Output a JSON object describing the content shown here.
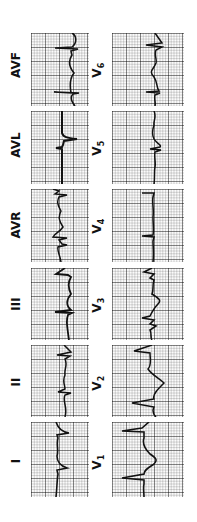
{
  "figure": {
    "orientation": "rotated -90deg",
    "leads": [
      {
        "id": "I",
        "label": "I",
        "column": "limb",
        "row": 6
      },
      {
        "id": "II",
        "label": "II",
        "column": "limb",
        "row": 5
      },
      {
        "id": "III",
        "label": "III",
        "column": "limb",
        "row": 4
      },
      {
        "id": "AVR",
        "label": "AVR",
        "column": "limb",
        "row": 3
      },
      {
        "id": "AVL",
        "label": "AVL",
        "column": "limb",
        "row": 2
      },
      {
        "id": "AVF",
        "label": "AVF",
        "column": "limb",
        "row": 1
      },
      {
        "id": "V1",
        "label": "V1",
        "column": "precordial",
        "row": 6
      },
      {
        "id": "V2",
        "label": "V2",
        "column": "precordial",
        "row": 5
      },
      {
        "id": "V3",
        "label": "V3",
        "column": "precordial",
        "row": 4
      },
      {
        "id": "V4",
        "label": "V4",
        "column": "precordial",
        "row": 3
      },
      {
        "id": "V5",
        "label": "V5",
        "column": "precordial",
        "row": 2
      },
      {
        "id": "V6",
        "label": "V6",
        "column": "precordial",
        "row": 1
      }
    ]
  },
  "labels": {
    "I": "I",
    "II": "II",
    "III": "III",
    "AVR": "AVR",
    "AVL": "AVL",
    "AVF": "AVF",
    "V1": "V",
    "V2": "V",
    "V3": "V",
    "V4": "V",
    "V5": "V",
    "V6": "V",
    "V1s": "1",
    "V2s": "2",
    "V3s": "3",
    "V4s": "4",
    "V5s": "5",
    "V6s": "6"
  },
  "colors": {
    "trace": "#111111",
    "grid_major": "#888888",
    "grid_minor": "#cccccc",
    "paper": "#fbfbfb"
  }
}
